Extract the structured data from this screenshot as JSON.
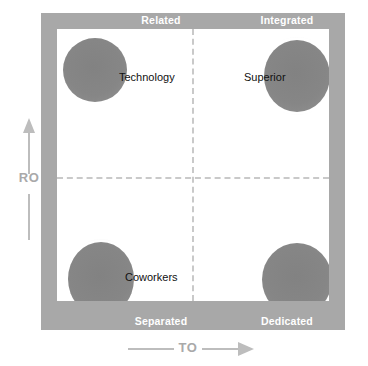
{
  "chart_data": {
    "type": "scatter",
    "title": "",
    "xlabel": "TO",
    "ylabel": "RO",
    "grid": false,
    "legend": "none",
    "axis_style": "two-by-two-quadrant-matrix",
    "quadrant_labels": {
      "top_left": "Related",
      "top_right": "Integrated",
      "bottom_left": "Separated",
      "bottom_right": "Dedicated"
    },
    "x": [
      0.12,
      0.88,
      0.14,
      0.86
    ],
    "y": [
      0.87,
      0.85,
      0.13,
      0.13
    ],
    "points": [
      {
        "name": "Technology",
        "quadrant": "top_left",
        "label": "Technology",
        "x": 0.12,
        "y": 0.87,
        "labeled": true
      },
      {
        "name": "Superior",
        "quadrant": "top_right",
        "label": "Superior",
        "x": 0.88,
        "y": 0.85,
        "labeled": true
      },
      {
        "name": "Coworkers",
        "quadrant": "bottom_left",
        "label": "Coworkers",
        "x": 0.14,
        "y": 0.13,
        "labeled": true
      },
      {
        "name": "Dedicated",
        "quadrant": "bottom_right",
        "label": "",
        "x": 0.86,
        "y": 0.13,
        "labeled": false
      }
    ],
    "xlim": [
      0,
      1
    ],
    "ylim": [
      0,
      1
    ],
    "colors": {
      "frame": "#a8a8a8",
      "plot_background": "#ffffff",
      "blob": "#888888",
      "divider": "#c9c9c9",
      "axis": "#bdbdbd",
      "corner_label_text": "#ffffff",
      "plot_label_text": "#111111"
    }
  },
  "frame": {
    "corners": {
      "top_left": "Related",
      "top_right": "Integrated",
      "bottom_left": "Separated",
      "bottom_right": "Dedicated"
    }
  },
  "plot": {
    "labels": {
      "technology": "Technology",
      "superior": "Superior",
      "coworkers": "Coworkers"
    }
  },
  "axes": {
    "y": {
      "label": "RO",
      "icon": "arrow-up-icon"
    },
    "x": {
      "label": "TO",
      "icon": "arrow-right-icon"
    }
  }
}
